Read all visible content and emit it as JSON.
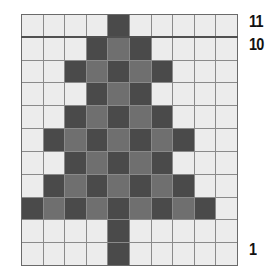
{
  "chart": {
    "columns": 10,
    "rows": 11,
    "colors": {
      "empty": "#ececec",
      "dark": "#4a4a4a",
      "medium": "#6f6f6f",
      "grid": "#8a8a8a"
    },
    "pattern_top_to_bottom": [
      "....D.....",
      "...DMD....",
      "..DMDMD...",
      "...DMD....",
      "..DMDMD...",
      ".DMDMDMD..",
      "..DMDMD...",
      ".DMDMDMD..",
      "DMDMDMDMD.",
      "....D.....",
      "....D....."
    ]
  },
  "row_labels": [
    {
      "text": "11",
      "row": 11
    },
    {
      "text": "10",
      "row": 10
    },
    {
      "text": "1",
      "row": 1
    }
  ]
}
